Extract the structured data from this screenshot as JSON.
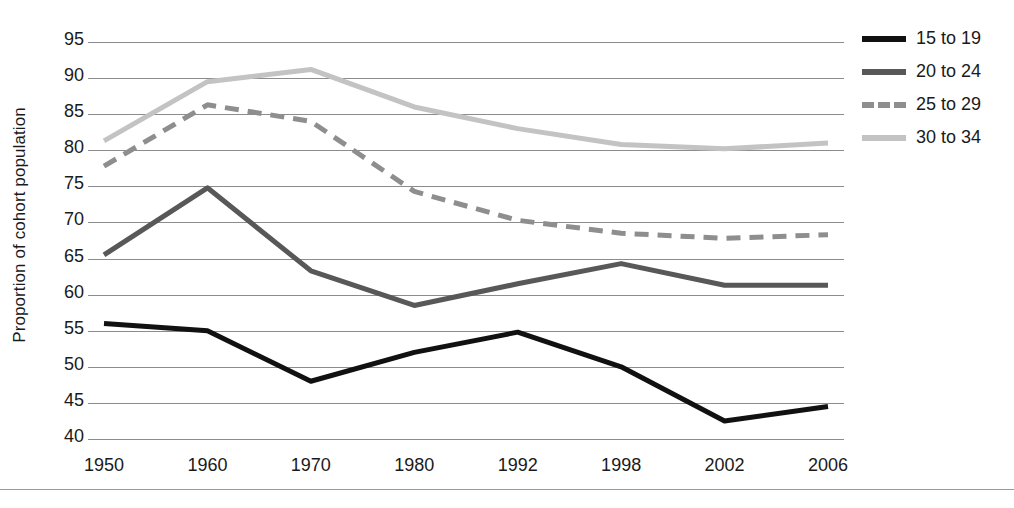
{
  "chart_data": {
    "type": "line",
    "title": "",
    "xlabel": "",
    "ylabel": "Proportion of cohort population",
    "categories": [
      "1950",
      "1960",
      "1970",
      "1980",
      "1992",
      "1998",
      "2002",
      "2006"
    ],
    "ylim": [
      40,
      95
    ],
    "yticks": [
      95,
      90,
      85,
      80,
      75,
      70,
      65,
      60,
      55,
      50,
      45,
      40
    ],
    "grid": true,
    "legend_position": "right",
    "series": [
      {
        "name": "15 to 19",
        "color": "#111111",
        "style": "solid",
        "width": 5,
        "values": [
          56.0,
          55.0,
          48.0,
          52.0,
          54.8,
          50.0,
          42.5,
          44.5
        ]
      },
      {
        "name": "20 to 24",
        "color": "#585858",
        "style": "solid",
        "width": 5,
        "values": [
          65.5,
          74.8,
          63.3,
          58.5,
          61.5,
          64.3,
          61.3,
          61.3
        ]
      },
      {
        "name": "25 to 29",
        "color": "#8e8e8e",
        "style": "dashed",
        "width": 5,
        "values": [
          77.8,
          86.3,
          84.0,
          74.3,
          70.3,
          68.5,
          67.8,
          68.3
        ]
      },
      {
        "name": "30 to 34",
        "color": "#c3c3c3",
        "style": "solid",
        "width": 5,
        "values": [
          81.3,
          89.5,
          91.2,
          86.0,
          83.0,
          80.8,
          80.2,
          81.0
        ]
      }
    ]
  },
  "axes": {
    "gridline_color": "#8c8c8c",
    "tick_label_color": "#1a1a1a"
  },
  "legend": {
    "entries": [
      "15 to 19",
      "20 to 24",
      "25 to 29",
      "30 to 34"
    ]
  }
}
